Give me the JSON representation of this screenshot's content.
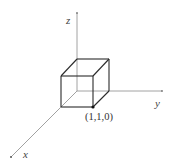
{
  "diagram": {
    "type": "3d-coordinate-cube",
    "axes": {
      "x": {
        "label": "x"
      },
      "y": {
        "label": "y"
      },
      "z": {
        "label": "z"
      }
    },
    "point": {
      "label": "(1,1,0)"
    },
    "colors": {
      "axis": "#8a8a8a",
      "edge": "#2a2a2a",
      "background": "#ffffff"
    }
  }
}
